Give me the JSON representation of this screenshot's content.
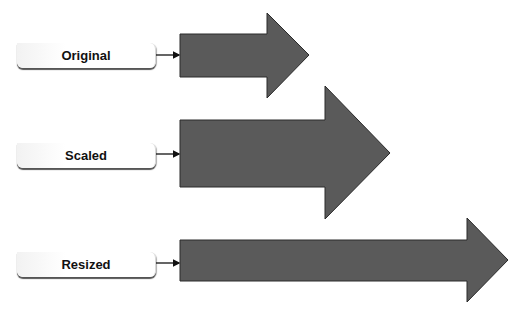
{
  "diagram": {
    "rows": [
      {
        "label": "Original"
      },
      {
        "label": "Scaled"
      },
      {
        "label": "Resized"
      }
    ],
    "colors": {
      "arrow_fill": "#5a5a5a",
      "arrow_stroke": "#2a2a2a",
      "connector": "#111111",
      "label_bg": "#ffffff"
    }
  }
}
